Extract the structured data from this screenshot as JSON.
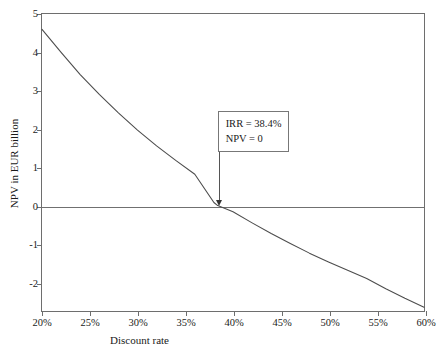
{
  "chart_data": {
    "type": "line",
    "title": "",
    "xlabel": "Discount rate",
    "ylabel": "NPV in EUR billion",
    "xlim": [
      20,
      60
    ],
    "ylim": [
      -2.75,
      5
    ],
    "xticks": [
      "20%",
      "25%",
      "30%",
      "35%",
      "40%",
      "45%",
      "50%",
      "55%",
      "60%"
    ],
    "xtick_values": [
      20,
      25,
      30,
      35,
      40,
      45,
      50,
      55,
      60
    ],
    "yticks": [
      "5",
      "4",
      "3",
      "2",
      "1",
      "0",
      "-1",
      "-2"
    ],
    "ytick_values": [
      5,
      4,
      3,
      2,
      1,
      0,
      -1,
      -2
    ],
    "grid": false,
    "legend": "none",
    "x": [
      20,
      22,
      24,
      26,
      28,
      30,
      32,
      34,
      36,
      38,
      38.4,
      40,
      42,
      44,
      46,
      48,
      50,
      52,
      54,
      56,
      58,
      60
    ],
    "y": [
      4.6,
      4.0,
      3.42,
      2.9,
      2.42,
      1.97,
      1.56,
      1.18,
      0.82,
      0.08,
      0.0,
      -0.16,
      -0.45,
      -0.73,
      -0.99,
      -1.24,
      -1.47,
      -1.69,
      -1.9,
      -2.17,
      -2.42,
      -2.65
    ],
    "series": [
      {
        "name": "NPV curve",
        "color": "#4d4d4d",
        "values": [
          4.6,
          4.0,
          3.42,
          2.9,
          2.42,
          1.97,
          1.56,
          1.18,
          0.82,
          0.08,
          0.0,
          -0.16,
          -0.45,
          -0.73,
          -0.99,
          -1.24,
          -1.47,
          -1.69,
          -1.9,
          -2.17,
          -2.42,
          -2.65
        ]
      }
    ],
    "zero_line": 0,
    "annotations": [
      {
        "name": "irr-callout",
        "lines": [
          "IRR = 38.4%",
          "NPV = 0"
        ],
        "point_x": 38.4,
        "point_y": 0
      }
    ]
  },
  "annotation": {
    "line1": "IRR = 38.4%",
    "line2": "NPV = 0"
  },
  "axes": {
    "x_title": "Discount rate",
    "y_title": "NPV in EUR billion"
  },
  "caption": {
    "text": ""
  },
  "colors": {
    "curve": "#4d4d4d",
    "frame": "#6e6e6e",
    "zero_line": "#707070",
    "annotation_border": "#777777",
    "text": "#1a1a1a"
  }
}
